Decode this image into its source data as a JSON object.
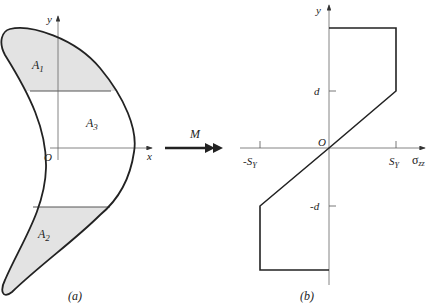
{
  "panel_a": {
    "caption": "(a)",
    "y_axis_label": "y",
    "x_axis_label": "x",
    "origin_label": "O",
    "regions": [
      {
        "name": "A",
        "sub": "1",
        "shaded": true
      },
      {
        "name": "A",
        "sub": "3",
        "shaded": false
      },
      {
        "name": "A",
        "sub": "2",
        "shaded": true
      }
    ],
    "shade_color": "#e3e3e3"
  },
  "moment": {
    "label": "M"
  },
  "panel_b": {
    "caption": "(b)",
    "y_axis_label": "y",
    "x_axis_label": "σ",
    "x_axis_sub": "zz",
    "origin_label": "O",
    "y_ticks": [
      {
        "label": "d"
      },
      {
        "label": "-d"
      }
    ],
    "x_ticks": [
      {
        "label": "-S",
        "sub": "Y"
      },
      {
        "label": "S",
        "sub": "Y"
      }
    ],
    "stress_profile": {
      "description": "elastic-perfectly-plastic bending stress distribution",
      "points_normalized": [
        {
          "sigma": "S_Y",
          "y": "top"
        },
        {
          "sigma": "S_Y",
          "y": "d"
        },
        {
          "sigma": "0",
          "y": "0"
        },
        {
          "sigma": "-S_Y",
          "y": "-d"
        },
        {
          "sigma": "-S_Y",
          "y": "bottom"
        }
      ]
    }
  }
}
